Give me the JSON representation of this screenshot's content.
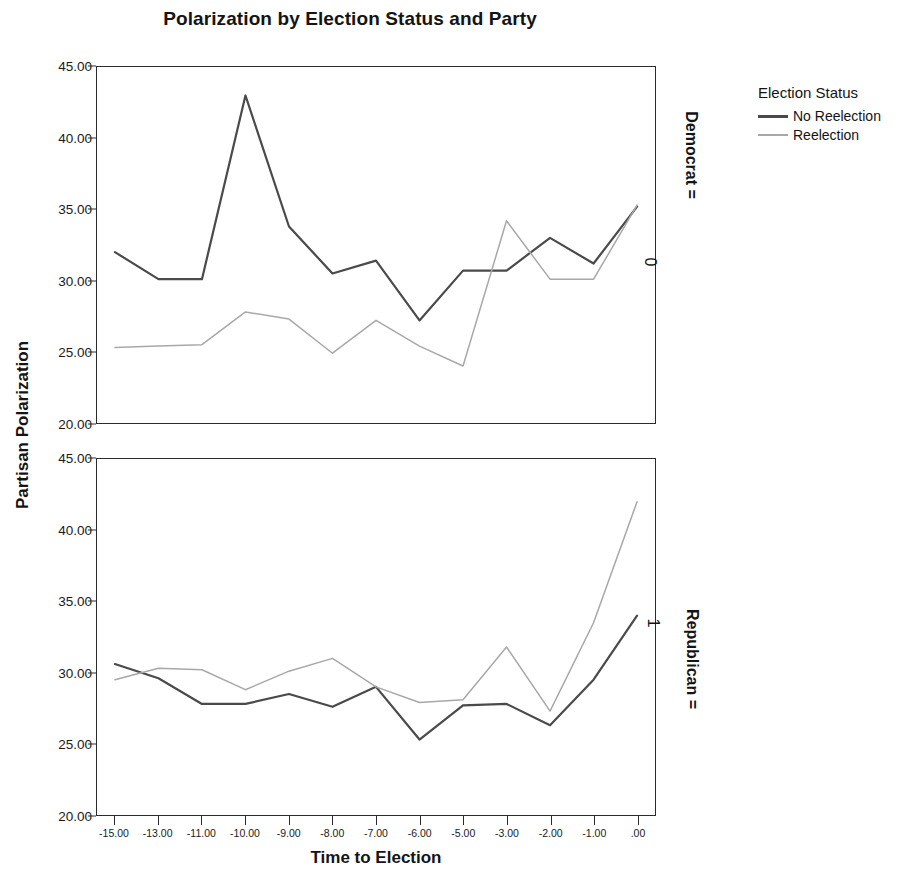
{
  "chart_data": {
    "type": "line",
    "title": "Polarization by Election Status and Party",
    "xlabel": "Time to Election",
    "ylabel": "Partisan Polarization",
    "grid": false,
    "legend_position": "right",
    "legend_title": "Election Status",
    "ylim": [
      20,
      45
    ],
    "yticks": [
      "20.00",
      "25.00",
      "30.00",
      "35.00",
      "40.00",
      "45.00"
    ],
    "ytick_values": [
      20,
      25,
      30,
      35,
      40,
      45
    ],
    "x": [
      -15,
      -13,
      -11,
      -10,
      -9,
      -8,
      -7,
      -6,
      -5,
      -3,
      -2,
      -1,
      0
    ],
    "xticks": [
      "-15.00",
      "-13.00",
      "-11.00",
      "-10.00",
      "-9.00",
      "-8.00",
      "-7.00",
      "-6.00",
      "-5.00",
      "-3.00",
      "-2.00",
      "-1.00",
      ".00"
    ],
    "panels": [
      {
        "strip_name": "Democrat =",
        "strip_value": "0",
        "series": [
          {
            "name": "No Reelection",
            "color": "#4a4a4a",
            "width": 2.2,
            "values": [
              32.0,
              30.1,
              30.1,
              43.0,
              33.8,
              30.5,
              31.4,
              27.2,
              30.7,
              30.7,
              33.0,
              31.2,
              35.2
            ]
          },
          {
            "name": "Reelection",
            "color": "#a8a8a8",
            "width": 1.5,
            "values": [
              25.3,
              25.4,
              25.5,
              27.8,
              27.3,
              24.9,
              27.2,
              25.4,
              24.0,
              34.2,
              30.1,
              30.1,
              35.3
            ]
          }
        ]
      },
      {
        "strip_name": "Republican =",
        "strip_value": "1",
        "series": [
          {
            "name": "No Reelection",
            "color": "#4a4a4a",
            "width": 2.2,
            "values": [
              30.6,
              29.6,
              27.8,
              27.8,
              28.5,
              27.6,
              29.0,
              25.3,
              27.7,
              27.8,
              26.3,
              29.5,
              34.0
            ]
          },
          {
            "name": "Reelection",
            "color": "#a8a8a8",
            "width": 1.5,
            "values": [
              29.5,
              30.3,
              30.2,
              28.8,
              30.1,
              31.0,
              29.0,
              27.9,
              28.1,
              31.8,
              27.3,
              33.5,
              42.0
            ]
          }
        ]
      }
    ]
  }
}
